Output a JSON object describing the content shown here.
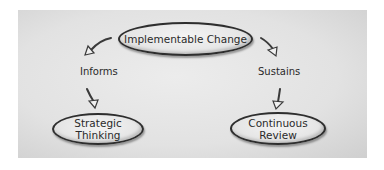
{
  "diagram": {
    "root": {
      "label": "Implementable Change"
    },
    "branches": [
      {
        "relation": "Informs",
        "target": {
          "label_line1": "Strategic",
          "label_line2": "Thinking"
        }
      },
      {
        "relation": "Sustains",
        "target": {
          "label_line1": "Continuous",
          "label_line2": "Review"
        }
      }
    ]
  },
  "colors": {
    "panel": "#e2e2e2",
    "outline": "#2e2e2e",
    "text": "#2a2a2a"
  }
}
